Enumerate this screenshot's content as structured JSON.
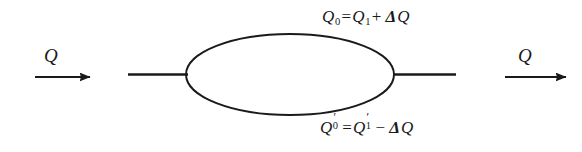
{
  "figure": {
    "background_color": "#ffffff",
    "ink_color": "#1a1a1a",
    "width": 582,
    "height": 152
  },
  "flow": {
    "inlet_label": "Q",
    "outlet_label": "Q"
  },
  "branches": {
    "upper": {
      "symbol": "Q",
      "subscript_left": "0",
      "equals": "=",
      "term_symbol": "Q",
      "term_subscript": "1",
      "operator": "+",
      "delta": "Δ",
      "delta_var": "Q",
      "text": "Q0=Q1+ΔQ"
    },
    "lower": {
      "symbol": "Q",
      "prime": "′",
      "subscript_left": "0",
      "equals": "=",
      "term_symbol": "Q",
      "term_prime": "′",
      "term_subscript": "1",
      "operator": "−",
      "delta": "Δ",
      "delta_var": "Q",
      "text": "Q′0=Q′1−ΔQ"
    }
  },
  "geometry": {
    "inlet_arrow": {
      "x1": 35,
      "x2": 90,
      "y": 77
    },
    "outlet_arrow": {
      "x1": 505,
      "x2": 566,
      "y": 77
    },
    "inlet_lead": {
      "x1": 128,
      "x2": 187,
      "y": 74
    },
    "outlet_lead": {
      "x1": 394,
      "x2": 456,
      "y": 74
    },
    "loop": {
      "cx": 290,
      "cy": 74,
      "rx": 104,
      "ry": 41
    }
  }
}
